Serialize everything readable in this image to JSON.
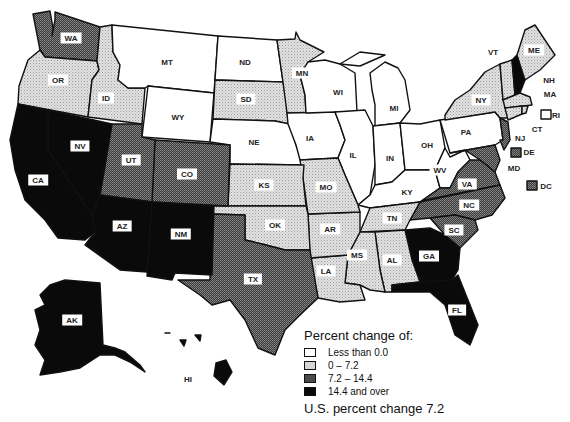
{
  "legend": {
    "title": "Percent change of:",
    "categories": [
      {
        "label": "Less than 0.0",
        "class": "c0",
        "color": "#ffffff"
      },
      {
        "label": "0 – 7.2",
        "class": "c1",
        "color": "#d9d9d9"
      },
      {
        "label": "7.2 – 14.4",
        "class": "c2",
        "color": "#555555"
      },
      {
        "label": "14.4 and over",
        "class": "c3",
        "color": "#0a0a0a"
      }
    ],
    "footer": "U.S. percent change 7.2"
  },
  "states": [
    {
      "abbr": "WA",
      "class": "c2",
      "x": 71,
      "y": 38
    },
    {
      "abbr": "OR",
      "class": "c1",
      "x": 58,
      "y": 80
    },
    {
      "abbr": "ID",
      "class": "c1",
      "x": 106,
      "y": 98
    },
    {
      "abbr": "MT",
      "class": "c0",
      "x": 167,
      "y": 62
    },
    {
      "abbr": "WY",
      "class": "c0",
      "x": 178,
      "y": 117
    },
    {
      "abbr": "ND",
      "class": "c0",
      "x": 245,
      "y": 62
    },
    {
      "abbr": "SD",
      "class": "c1",
      "x": 246,
      "y": 99
    },
    {
      "abbr": "NE",
      "class": "c0",
      "x": 254,
      "y": 142
    },
    {
      "abbr": "MN",
      "class": "c1",
      "x": 302,
      "y": 73
    },
    {
      "abbr": "IA",
      "class": "c0",
      "x": 310,
      "y": 138
    },
    {
      "abbr": "WI",
      "class": "c0",
      "x": 338,
      "y": 92
    },
    {
      "abbr": "MI",
      "class": "c0",
      "x": 394,
      "y": 108
    },
    {
      "abbr": "IL",
      "class": "c0",
      "x": 353,
      "y": 155
    },
    {
      "abbr": "IN",
      "class": "c0",
      "x": 390,
      "y": 158
    },
    {
      "abbr": "OH",
      "class": "c0",
      "x": 427,
      "y": 145
    },
    {
      "abbr": "KY",
      "class": "c0",
      "x": 407,
      "y": 192
    },
    {
      "abbr": "WV",
      "class": "c0",
      "x": 440,
      "y": 170
    },
    {
      "abbr": "PA",
      "class": "c0",
      "x": 466,
      "y": 132
    },
    {
      "abbr": "NY",
      "class": "c1",
      "x": 481,
      "y": 100
    },
    {
      "abbr": "VT",
      "class": "c1",
      "x": 493,
      "y": 52
    },
    {
      "abbr": "NH",
      "class": "c3",
      "x": 549,
      "y": 80
    },
    {
      "abbr": "ME",
      "class": "c1",
      "x": 534,
      "y": 50
    },
    {
      "abbr": "MA",
      "class": "c1",
      "x": 550,
      "y": 94
    },
    {
      "abbr": "RI",
      "class": "c0",
      "x": 556,
      "y": 115
    },
    {
      "abbr": "CT",
      "class": "c1",
      "x": 537,
      "y": 129
    },
    {
      "abbr": "NJ",
      "class": "c2",
      "x": 520,
      "y": 138
    },
    {
      "abbr": "DE",
      "class": "c2",
      "x": 529,
      "y": 152
    },
    {
      "abbr": "MD",
      "class": "c2",
      "x": 514,
      "y": 168
    },
    {
      "abbr": "DC",
      "class": "c2",
      "x": 546,
      "y": 186
    },
    {
      "abbr": "VA",
      "class": "c2",
      "x": 467,
      "y": 184
    },
    {
      "abbr": "NC",
      "class": "c2",
      "x": 469,
      "y": 205
    },
    {
      "abbr": "SC",
      "class": "c2",
      "x": 454,
      "y": 230
    },
    {
      "abbr": "GA",
      "class": "c3",
      "x": 429,
      "y": 256
    },
    {
      "abbr": "FL",
      "class": "c3",
      "x": 457,
      "y": 310
    },
    {
      "abbr": "TN",
      "class": "c1",
      "x": 392,
      "y": 218
    },
    {
      "abbr": "AL",
      "class": "c1",
      "x": 392,
      "y": 260
    },
    {
      "abbr": "MS",
      "class": "c1",
      "x": 357,
      "y": 255
    },
    {
      "abbr": "AR",
      "class": "c1",
      "x": 330,
      "y": 229
    },
    {
      "abbr": "LA",
      "class": "c1",
      "x": 326,
      "y": 271
    },
    {
      "abbr": "MO",
      "class": "c1",
      "x": 326,
      "y": 187
    },
    {
      "abbr": "KS",
      "class": "c1",
      "x": 264,
      "y": 185
    },
    {
      "abbr": "OK",
      "class": "c1",
      "x": 275,
      "y": 225
    },
    {
      "abbr": "TX",
      "class": "c2",
      "x": 253,
      "y": 279
    },
    {
      "abbr": "CO",
      "class": "c2",
      "x": 187,
      "y": 174
    },
    {
      "abbr": "UT",
      "class": "c2",
      "x": 131,
      "y": 160
    },
    {
      "abbr": "NV",
      "class": "c3",
      "x": 80,
      "y": 146
    },
    {
      "abbr": "CA",
      "class": "c3",
      "x": 38,
      "y": 180
    },
    {
      "abbr": "AZ",
      "class": "c3",
      "x": 122,
      "y": 226
    },
    {
      "abbr": "NM",
      "class": "c3",
      "x": 181,
      "y": 234
    },
    {
      "abbr": "AK",
      "class": "c3",
      "x": 72,
      "y": 320
    },
    {
      "abbr": "HI",
      "class": "c1",
      "x": 188,
      "y": 379
    }
  ]
}
